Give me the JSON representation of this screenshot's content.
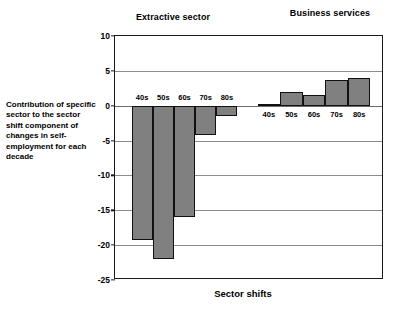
{
  "chart_data": {
    "type": "bar",
    "title": "",
    "xlabel": "Sector shifts",
    "ylabel": "Contribution of specific sector to the sector shift component of changes in self-employment for each decade",
    "categories": [
      "40s",
      "50s",
      "60s",
      "70s",
      "80s"
    ],
    "ylim": [
      -25,
      10
    ],
    "yticks": [
      10,
      5,
      0,
      -5,
      -10,
      -15,
      -20,
      -25
    ],
    "ytick_labels": [
      "10",
      "5",
      "0",
      "-5",
      "-10",
      "-15",
      "-20",
      "-25"
    ],
    "grid": true,
    "legend": "none",
    "groups": [
      {
        "name": "Extractive sector",
        "categories": [
          "40s",
          "50s",
          "60s",
          "70s",
          "80s"
        ],
        "values": [
          -19.3,
          -22.0,
          -16.0,
          -4.2,
          -1.5
        ],
        "label_position": "above-zero"
      },
      {
        "name": "Business services",
        "categories": [
          "40s",
          "50s",
          "60s",
          "70s",
          "80s"
        ],
        "values": [
          0.3,
          2.0,
          1.6,
          3.7,
          4.0
        ],
        "label_position": "below-zero"
      }
    ],
    "bar_fill_color": "#808080",
    "bar_edge_color": "#111111",
    "grid_color": "#8c8c8c",
    "axis_color": "#1a1a1a",
    "background_color": "#ffffff"
  },
  "titles": {
    "extractive": "Extractive sector",
    "business": "Business services",
    "x_axis": "Sector shifts"
  },
  "y_caption": "Contribution of specific sector to the sector shift component of changes in self-employment for each decade"
}
